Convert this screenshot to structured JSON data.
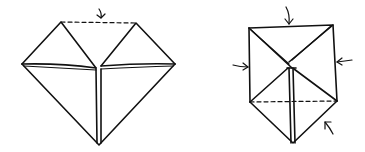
{
  "diagram": {
    "type": "origami-fold-steps",
    "ink_color": "#111111",
    "background": "#ffffff",
    "figures": [
      {
        "id": "step-left",
        "description": "Heart-shaped fold: two top flaps with a valley fold dashed line between peaks, arrow indicating fold down",
        "annotations": [
          "fold-arrow-down",
          "dashed-valley-line"
        ]
      },
      {
        "id": "step-right",
        "description": "Square with diagonal folds meeting at center, triangular bottom point, dashed fold line across base",
        "annotations": [
          "arrow-top-down",
          "arrow-left-in",
          "arrow-right-in",
          "arrow-bottom-right-up",
          "dashed-base-line"
        ]
      }
    ]
  }
}
